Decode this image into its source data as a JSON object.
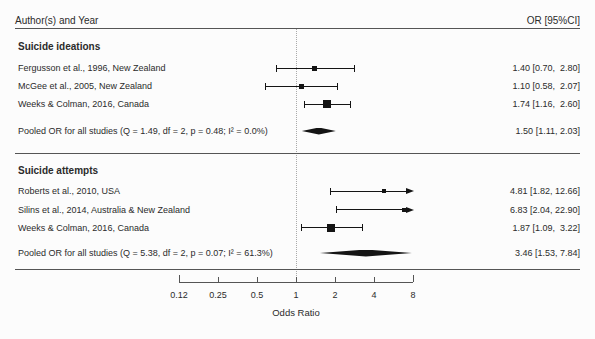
{
  "header": {
    "left_label": "Author(s) and Year",
    "right_label": "OR [95%CI]"
  },
  "chart_data": {
    "type": "forest",
    "or_axis": {
      "label": "Odds Ratio",
      "scale": "log2",
      "min": 0.125,
      "max": 8,
      "reference_line": 1,
      "ticks": [
        {
          "value": 0.125,
          "label": "0.12"
        },
        {
          "value": 0.25,
          "label": "0.25"
        },
        {
          "value": 0.5,
          "label": "0.5"
        },
        {
          "value": 1,
          "label": "1"
        },
        {
          "value": 2,
          "label": "2"
        },
        {
          "value": 4,
          "label": "4"
        },
        {
          "value": 8,
          "label": "8"
        }
      ]
    },
    "sections": [
      {
        "title": "Suicide ideations",
        "studies": [
          {
            "label": "Fergusson et al., 1996, New Zealand",
            "or": 1.4,
            "ci_low": 0.7,
            "ci_high": 2.8,
            "or_text": "1.40 [0.70,  2.80]",
            "marker_size": 5
          },
          {
            "label": "McGee et al., 2005, New Zealand",
            "or": 1.1,
            "ci_low": 0.58,
            "ci_high": 2.07,
            "or_text": "1.10 [0.58,  2.07]",
            "marker_size": 5
          },
          {
            "label": "Weeks & Colman, 2016, Canada",
            "or": 1.74,
            "ci_low": 1.16,
            "ci_high": 2.6,
            "or_text": "1.74 [1.16,  2.60]",
            "marker_size": 8
          }
        ],
        "pooled": {
          "label": "Pooled OR for all studies (Q = 1.49, df = 2, p = 0.48; I² = 0.0%)",
          "or": 1.5,
          "ci_low": 1.11,
          "ci_high": 2.03,
          "or_text": "1.50 [1.11, 2.03]"
        }
      },
      {
        "title": "Suicide attempts",
        "studies": [
          {
            "label": "Roberts et al., 2010, USA",
            "or": 4.81,
            "ci_low": 1.82,
            "ci_high": 12.66,
            "or_text": "4.81 [1.82, 12.66]",
            "marker_size": 4
          },
          {
            "label": "Silins et al., 2014, Australia & New Zealand",
            "or": 6.83,
            "ci_low": 2.04,
            "ci_high": 22.9,
            "or_text": "6.83 [2.04, 22.90]",
            "marker_size": 4
          },
          {
            "label": "Weeks & Colman, 2016, Canada",
            "or": 1.87,
            "ci_low": 1.09,
            "ci_high": 3.22,
            "or_text": "1.87 [1.09,  3.22]",
            "marker_size": 8
          }
        ],
        "pooled": {
          "label": "Pooled OR for all studies (Q = 5.38, df = 2, p = 0.07; I² = 61.3%)",
          "or": 3.46,
          "ci_low": 1.53,
          "ci_high": 7.84,
          "or_text": "3.46 [1.53, 7.84]"
        }
      }
    ]
  },
  "colors": {
    "background": "#fcfcfc",
    "text": "#2b2b2b",
    "line": "#555555",
    "marker": "#141414",
    "reference": "#aaaaaa"
  }
}
